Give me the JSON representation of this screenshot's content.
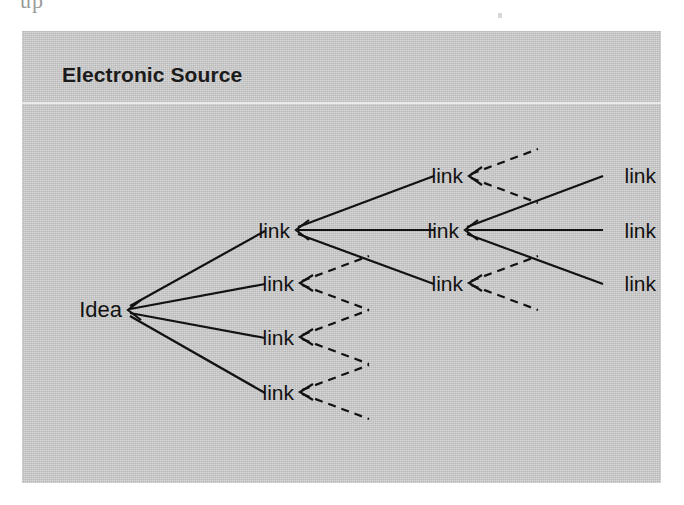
{
  "page": {
    "top_text_fragment": "up",
    "background_color": "#ffffff"
  },
  "figure": {
    "title": "Electronic Source",
    "panel_color": "#c6c6c6",
    "rule_color": "#ebebeb",
    "ink_color": "#121212"
  },
  "diagram": {
    "type": "tree",
    "root": {
      "id": "idea",
      "label": "Idea",
      "x": 100,
      "y": 279
    },
    "nodes": [
      {
        "id": "idea",
        "label": "Idea",
        "column": 1,
        "x": 100,
        "y": 279,
        "anchor_x": 100,
        "anchor_y": 279
      },
      {
        "id": "c2n1",
        "label": "link",
        "column": 2,
        "x": 268,
        "y": 199,
        "anchor_x": 268,
        "anchor_y": 199
      },
      {
        "id": "c2n2",
        "label": "link",
        "column": 2,
        "x": 268,
        "y": 252,
        "anchor_x": 268,
        "anchor_y": 252
      },
      {
        "id": "c2n3",
        "label": "link",
        "column": 2,
        "x": 268,
        "y": 306,
        "anchor_x": 268,
        "anchor_y": 306
      },
      {
        "id": "c2n4",
        "label": "link",
        "column": 2,
        "x": 268,
        "y": 361,
        "anchor_x": 268,
        "anchor_y": 361
      },
      {
        "id": "c3n1",
        "label": "link",
        "column": 3,
        "x": 437,
        "y": 144,
        "anchor_x": 437,
        "anchor_y": 144
      },
      {
        "id": "c3n2",
        "label": "link",
        "column": 3,
        "x": 437,
        "y": 199,
        "anchor_x": 437,
        "anchor_y": 199
      },
      {
        "id": "c3n3",
        "label": "link",
        "column": 3,
        "x": 437,
        "y": 252,
        "anchor_x": 437,
        "anchor_y": 252
      },
      {
        "id": "c4n1",
        "label": "link",
        "column": 4,
        "x": 607,
        "y": 144,
        "anchor_x": 607,
        "anchor_y": 144
      },
      {
        "id": "c4n2",
        "label": "link",
        "column": 4,
        "x": 607,
        "y": 199,
        "anchor_x": 607,
        "anchor_y": 199
      },
      {
        "id": "c4n3",
        "label": "link",
        "column": 4,
        "x": 607,
        "y": 252,
        "anchor_x": 607,
        "anchor_y": 252
      }
    ],
    "solid_edges": [
      {
        "from": "c2n1",
        "to": "idea"
      },
      {
        "from": "c2n2",
        "to": "idea"
      },
      {
        "from": "c2n3",
        "to": "idea"
      },
      {
        "from": "c2n4",
        "to": "idea"
      },
      {
        "from": "c3n1",
        "to": "c2n1"
      },
      {
        "from": "c3n2",
        "to": "c2n1"
      },
      {
        "from": "c3n3",
        "to": "c2n1"
      },
      {
        "from": "c4n1",
        "to": "c3n2"
      },
      {
        "from": "c4n2",
        "to": "c3n2"
      },
      {
        "from": "c4n3",
        "to": "c3n2"
      }
    ],
    "dashed_stubs": [
      {
        "at": "c3n1",
        "count": 2
      },
      {
        "at": "c2n2",
        "count": 2
      },
      {
        "at": "c3n3",
        "count": 2
      },
      {
        "at": "c2n3",
        "count": 2
      },
      {
        "at": "c2n4",
        "count": 2
      }
    ],
    "arrowheads": [
      {
        "at": "idea",
        "direction": "left"
      },
      {
        "at": "c2n1",
        "direction": "left"
      },
      {
        "at": "c2n2",
        "direction": "left"
      },
      {
        "at": "c2n3",
        "direction": "left"
      },
      {
        "at": "c2n4",
        "direction": "left"
      },
      {
        "at": "c3n1",
        "direction": "left"
      },
      {
        "at": "c3n2",
        "direction": "left"
      },
      {
        "at": "c3n3",
        "direction": "left"
      }
    ]
  }
}
